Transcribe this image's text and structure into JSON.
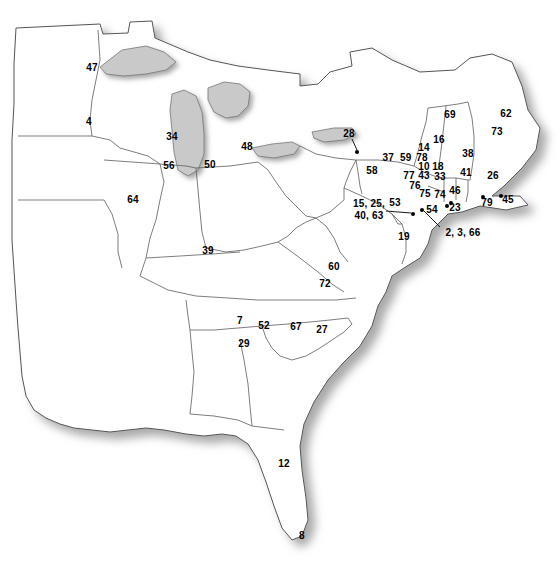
{
  "figure": {
    "type": "reference-map",
    "region": "Eastern United States",
    "width": 560,
    "height": 562,
    "background_color": "#ffffff",
    "land_fill": "#ffffff",
    "border_color": "#555555",
    "water_shadow_color": "#b4b4b4",
    "label_color": "#000000"
  },
  "labels": [
    {
      "id": "label-47",
      "text": "47",
      "x": 92,
      "y": 67,
      "multiline": false
    },
    {
      "id": "label-4",
      "text": "4",
      "x": 89,
      "y": 121,
      "multiline": false
    },
    {
      "id": "label-34",
      "text": "34",
      "x": 172,
      "y": 136,
      "multiline": false
    },
    {
      "id": "label-48",
      "text": "48",
      "x": 247,
      "y": 146,
      "multiline": false
    },
    {
      "id": "label-56",
      "text": "56",
      "x": 169,
      "y": 165,
      "multiline": false
    },
    {
      "id": "label-50",
      "text": "50",
      "x": 210,
      "y": 164,
      "multiline": false
    },
    {
      "id": "label-64",
      "text": "64",
      "x": 133,
      "y": 199,
      "multiline": false
    },
    {
      "id": "label-39",
      "text": "39",
      "x": 208,
      "y": 250,
      "multiline": false
    },
    {
      "id": "label-28",
      "text": "28",
      "x": 349,
      "y": 133,
      "multiline": false
    },
    {
      "id": "label-37-59",
      "text": "37  59",
      "x": 397,
      "y": 157,
      "multiline": false
    },
    {
      "id": "label-58",
      "text": "58",
      "x": 372,
      "y": 170,
      "multiline": false
    },
    {
      "id": "label-15-25-40-63",
      "text": "15, 25,\n40, 63",
      "x": 369,
      "y": 210,
      "multiline": true
    },
    {
      "id": "label-19",
      "text": "19",
      "x": 404,
      "y": 236,
      "multiline": false
    },
    {
      "id": "label-53",
      "text": "53",
      "x": 395,
      "y": 202,
      "multiline": false
    },
    {
      "id": "label-76",
      "text": "76",
      "x": 415,
      "y": 185,
      "multiline": false
    },
    {
      "id": "label-77",
      "text": "77",
      "x": 409,
      "y": 175,
      "multiline": false
    },
    {
      "id": "label-43",
      "text": "43",
      "x": 424,
      "y": 175,
      "multiline": false
    },
    {
      "id": "label-75",
      "text": "75",
      "x": 425,
      "y": 193,
      "multiline": false
    },
    {
      "id": "label-74",
      "text": "74",
      "x": 440,
      "y": 194,
      "multiline": false
    },
    {
      "id": "label-10",
      "text": "10",
      "x": 424,
      "y": 166,
      "multiline": false
    },
    {
      "id": "label-18",
      "text": "18",
      "x": 438,
      "y": 166,
      "multiline": false
    },
    {
      "id": "label-33",
      "text": "33",
      "x": 440,
      "y": 176,
      "multiline": false
    },
    {
      "id": "label-14",
      "text": "14",
      "x": 424,
      "y": 147,
      "multiline": false
    },
    {
      "id": "label-78",
      "text": "78",
      "x": 422,
      "y": 157,
      "multiline": false
    },
    {
      "id": "label-16",
      "text": "16",
      "x": 439,
      "y": 139,
      "multiline": false
    },
    {
      "id": "label-69",
      "text": "69",
      "x": 450,
      "y": 114,
      "multiline": false
    },
    {
      "id": "label-38",
      "text": "38",
      "x": 468,
      "y": 153,
      "multiline": false
    },
    {
      "id": "label-41",
      "text": "41",
      "x": 466,
      "y": 172,
      "multiline": false
    },
    {
      "id": "label-62",
      "text": "62",
      "x": 506,
      "y": 113,
      "multiline": false
    },
    {
      "id": "label-73",
      "text": "73",
      "x": 497,
      "y": 131,
      "multiline": false
    },
    {
      "id": "label-26",
      "text": "26",
      "x": 493,
      "y": 175,
      "multiline": false
    },
    {
      "id": "label-46",
      "text": "46",
      "x": 455,
      "y": 190,
      "multiline": false
    },
    {
      "id": "label-23",
      "text": "23",
      "x": 455,
      "y": 207,
      "multiline": false
    },
    {
      "id": "label-54",
      "text": "54",
      "x": 432,
      "y": 209,
      "multiline": false
    },
    {
      "id": "label-79",
      "text": "79",
      "x": 487,
      "y": 202,
      "multiline": false
    },
    {
      "id": "label-45",
      "text": "45",
      "x": 508,
      "y": 199,
      "multiline": false
    },
    {
      "id": "label-2-3-66",
      "text": "2, 3, 66",
      "x": 463,
      "y": 232,
      "multiline": false
    },
    {
      "id": "label-60",
      "text": "60",
      "x": 334,
      "y": 266,
      "multiline": false
    },
    {
      "id": "label-72",
      "text": "72",
      "x": 325,
      "y": 283,
      "multiline": false
    },
    {
      "id": "label-7",
      "text": "7",
      "x": 240,
      "y": 320,
      "multiline": false
    },
    {
      "id": "label-52",
      "text": "52",
      "x": 264,
      "y": 325,
      "multiline": false
    },
    {
      "id": "label-67",
      "text": "67",
      "x": 296,
      "y": 326,
      "multiline": false
    },
    {
      "id": "label-27",
      "text": "27",
      "x": 322,
      "y": 329,
      "multiline": false
    },
    {
      "id": "label-29",
      "text": "29",
      "x": 244,
      "y": 343,
      "multiline": false
    },
    {
      "id": "label-12",
      "text": "12",
      "x": 284,
      "y": 463,
      "multiline": false
    },
    {
      "id": "label-8",
      "text": "8",
      "x": 302,
      "y": 535,
      "multiline": false
    }
  ],
  "site_dots": [
    {
      "id": "dot-28",
      "x": 357,
      "y": 152
    },
    {
      "id": "dot-15",
      "x": 413,
      "y": 214
    },
    {
      "id": "dot-54",
      "x": 422,
      "y": 210
    },
    {
      "id": "dot-23a",
      "x": 447,
      "y": 206
    },
    {
      "id": "dot-23b",
      "x": 451,
      "y": 203
    },
    {
      "id": "dot-79",
      "x": 483,
      "y": 197
    },
    {
      "id": "dot-45",
      "x": 501,
      "y": 196
    }
  ],
  "leader_lines": [
    {
      "id": "leader-28",
      "x1": 352,
      "y1": 139,
      "x2": 357,
      "y2": 150
    },
    {
      "id": "leader-15",
      "x1": 386,
      "y1": 211,
      "x2": 411,
      "y2": 213
    },
    {
      "id": "leader-2-3-66",
      "x1": 440,
      "y1": 227,
      "x2": 424,
      "y2": 211
    }
  ]
}
